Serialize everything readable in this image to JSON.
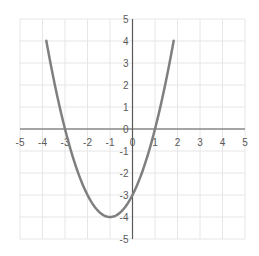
{
  "chart_data": {
    "type": "line",
    "title": "",
    "xlabel": "",
    "ylabel": "",
    "function": "y = x^2 + 2x - 3",
    "xlim": [
      -5,
      5
    ],
    "ylim": [
      -5,
      5
    ],
    "grid": true,
    "legend": null,
    "x_ticks": [
      "-5",
      "-4",
      "-3",
      "-2",
      "-1",
      "0",
      "1",
      "2",
      "3",
      "4",
      "5"
    ],
    "y_ticks": [
      "5",
      "4",
      "3",
      "2",
      "1",
      "0",
      "-1",
      "-2",
      "-3",
      "-4",
      "-5"
    ],
    "series": [
      {
        "name": "parabola",
        "color": "#7f7f7f",
        "x": [
          -3.83,
          -3.5,
          -3,
          -2.5,
          -2,
          -1.5,
          -1,
          -0.5,
          0,
          0.5,
          1,
          1.5,
          1.83
        ],
        "y": [
          5.0,
          2.25,
          0,
          -1.75,
          -3,
          -3.75,
          -4,
          -3.75,
          -3,
          -1.75,
          0,
          2.25,
          5.0
        ]
      }
    ],
    "annotations": {
      "vertex": [
        -1,
        -4
      ],
      "roots": [
        -3,
        1
      ],
      "y_intercept": -3
    }
  },
  "colors": {
    "curve": "#7f7f7f",
    "axis": "#595959",
    "grid": "#e6e6e6",
    "text": "#595959"
  }
}
